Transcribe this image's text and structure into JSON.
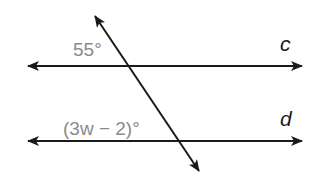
{
  "diagram": {
    "type": "parallel-lines-transversal",
    "lines": [
      {
        "name": "c",
        "label": "c",
        "y": 66,
        "x1": 27,
        "x2": 303
      },
      {
        "name": "d",
        "label": "d",
        "y": 141,
        "x1": 27,
        "x2": 303
      }
    ],
    "transversal": {
      "x1": 94,
      "y1": 15,
      "x2": 200,
      "y2": 172
    },
    "angles": [
      {
        "label": "55°",
        "position": "upper-left of intersection with c"
      },
      {
        "label": "(3w − 2)°",
        "position": "upper-left of intersection with d"
      }
    ],
    "colors": {
      "lines": "#1a1a1a",
      "angle_text": "#8a8a8a"
    }
  }
}
